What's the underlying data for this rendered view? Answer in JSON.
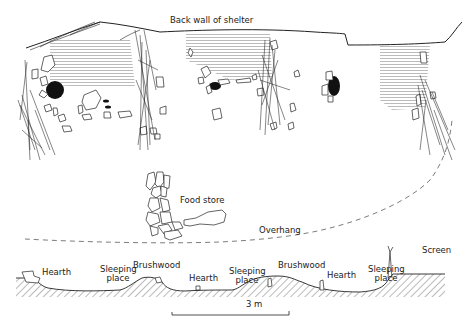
{
  "plan": {
    "back_wall_label": "Back wall of shelter",
    "food_store_label": "Food store",
    "overhang_label": "Overhang"
  },
  "section": {
    "labels": [
      {
        "id": "hearth-1",
        "text": "Hearth"
      },
      {
        "id": "sleeping-place-1",
        "text": "Sleeping\nplace"
      },
      {
        "id": "brushwood-1",
        "text": "Brushwood"
      },
      {
        "id": "hearth-2",
        "text": "Hearth"
      },
      {
        "id": "sleeping-place-2",
        "text": "Sleeping\nplace"
      },
      {
        "id": "brushwood-2",
        "text": "Brushwood"
      },
      {
        "id": "hearth-3",
        "text": "Hearth"
      },
      {
        "id": "sleeping-place-3",
        "text": "Sleeping\nplace"
      },
      {
        "id": "screen",
        "text": "Screen"
      }
    ]
  },
  "scale_bar": {
    "label": "3 m"
  },
  "colors": {
    "ink": "#222222",
    "hatch": "#555555",
    "background": "#ffffff"
  }
}
